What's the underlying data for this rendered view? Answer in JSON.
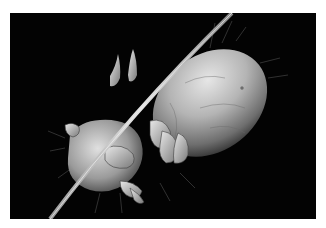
{
  "image": {
    "subject": "Scanning electron micrograph of a mite clinging to a hair",
    "alt": "Grayscale SEM image of a mite with oval body and legs gripping a curved hair strand on a black background",
    "colors": {
      "border": "#ffffff",
      "background": "#030303",
      "body_light": "#d8d8d8",
      "body_mid": "#8a8a8a",
      "body_dark": "#3a3a3a",
      "hair": "#cfcfcf"
    }
  }
}
